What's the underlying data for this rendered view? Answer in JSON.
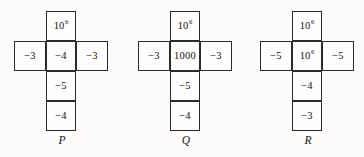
{
  "figure": {
    "background_color": "#fdfcfa",
    "line_color": "#2b2b2b",
    "text_color": "#111111",
    "nets": [
      {
        "label": "P",
        "cells": {
          "top": {
            "base": "10",
            "exponent": "6"
          },
          "left": {
            "base": "−3",
            "exponent": ""
          },
          "middle": {
            "base": "−4",
            "exponent": ""
          },
          "right": {
            "base": "−3",
            "exponent": ""
          },
          "lower": {
            "base": "−5",
            "exponent": ""
          },
          "bottom": {
            "base": "−4",
            "exponent": ""
          }
        }
      },
      {
        "label": "Q",
        "cells": {
          "top": {
            "base": "10",
            "exponent": "6"
          },
          "left": {
            "base": "−3",
            "exponent": ""
          },
          "middle": {
            "base": "1000",
            "exponent": ""
          },
          "right": {
            "base": "−3",
            "exponent": ""
          },
          "lower": {
            "base": "−5",
            "exponent": ""
          },
          "bottom": {
            "base": "−4",
            "exponent": ""
          }
        }
      },
      {
        "label": "R",
        "cells": {
          "top": {
            "base": "10",
            "exponent": "6"
          },
          "left": {
            "base": "−5",
            "exponent": ""
          },
          "middle": {
            "base": "10",
            "exponent": "6"
          },
          "right": {
            "base": "−5",
            "exponent": ""
          },
          "lower": {
            "base": "−4",
            "exponent": ""
          },
          "bottom": {
            "base": "−3",
            "exponent": ""
          }
        }
      }
    ]
  }
}
